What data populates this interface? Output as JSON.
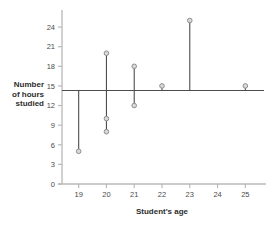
{
  "chart_data": {
    "type": "scatter",
    "title": "",
    "xlabel": "Student's age",
    "ylabel": "Number of hours studied",
    "ylabel_lines": [
      "Number",
      "of hours",
      "studied"
    ],
    "x": [
      19,
      20,
      21,
      22,
      23,
      25
    ],
    "xlim": [
      18.4,
      25.6
    ],
    "ylim": [
      0,
      26
    ],
    "xticks": [
      19,
      20,
      21,
      22,
      23,
      24,
      25
    ],
    "xtick_labels": [
      "19",
      "20",
      "21",
      "22",
      "23",
      "24",
      "25"
    ],
    "yticks": [
      0,
      3,
      6,
      9,
      12,
      15,
      18,
      21,
      24
    ],
    "ytick_labels": [
      "0",
      "3",
      "6",
      "9",
      "12",
      "15",
      "18",
      "21",
      "24"
    ],
    "grid": false,
    "legend": "none",
    "mean_line_value": 14.3,
    "points": [
      {
        "x": 19,
        "y": 5
      },
      {
        "x": 20,
        "y": 20
      },
      {
        "x": 20,
        "y": 10
      },
      {
        "x": 20,
        "y": 8
      },
      {
        "x": 21,
        "y": 18
      },
      {
        "x": 21,
        "y": 12
      },
      {
        "x": 22,
        "y": 15
      },
      {
        "x": 23,
        "y": 25
      },
      {
        "x": 25,
        "y": 15
      }
    ],
    "residual_segments": [
      {
        "x": 19,
        "y_from": 14.3,
        "y_to": 5
      },
      {
        "x": 20,
        "y_from": 20,
        "y_to": 8
      },
      {
        "x": 21,
        "y_from": 18,
        "y_to": 12
      },
      {
        "x": 22,
        "y_from": 14.3,
        "y_to": 15
      },
      {
        "x": 23,
        "y_from": 14.3,
        "y_to": 25
      },
      {
        "x": 25,
        "y_from": 14.3,
        "y_to": 15
      }
    ],
    "colors": {
      "axis": "#b8b8b8",
      "marker_edge": "#8e8e8e",
      "marker_fill": "#d9d9d9",
      "segment": "#4d4d4d",
      "mean_line": "#4d4d4d",
      "text": "#3a3a3a",
      "background": "#ffffff"
    }
  }
}
